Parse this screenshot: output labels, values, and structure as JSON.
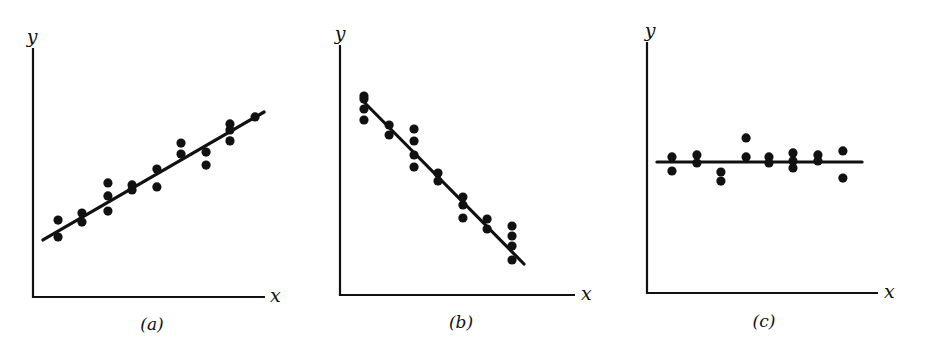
{
  "figure": {
    "ink_color": "#111111",
    "background": "#ffffff"
  },
  "chart_data": [
    {
      "type": "scatter",
      "panel_label": "(a)",
      "caption_letter": "a",
      "xlabel": "x",
      "ylabel": "y",
      "title": "",
      "grid": false,
      "legend": null,
      "xlim": [
        0,
        100
      ],
      "ylim": [
        0,
        100
      ],
      "trend": "positive linear",
      "points": [
        {
          "x": 10.8,
          "y": 30.9
        },
        {
          "x": 10.8,
          "y": 24.1
        },
        {
          "x": 21.1,
          "y": 33.7
        },
        {
          "x": 21.1,
          "y": 30.1
        },
        {
          "x": 32.3,
          "y": 45.8
        },
        {
          "x": 32.3,
          "y": 40.6
        },
        {
          "x": 32.3,
          "y": 34.5
        },
        {
          "x": 42.7,
          "y": 45.0
        },
        {
          "x": 42.7,
          "y": 43.0
        },
        {
          "x": 53.4,
          "y": 51.4
        },
        {
          "x": 53.4,
          "y": 44.2
        },
        {
          "x": 63.8,
          "y": 61.8
        },
        {
          "x": 63.8,
          "y": 57.4
        },
        {
          "x": 74.6,
          "y": 58.2
        },
        {
          "x": 74.6,
          "y": 53.0
        },
        {
          "x": 84.9,
          "y": 69.5
        },
        {
          "x": 84.9,
          "y": 67.1
        },
        {
          "x": 84.9,
          "y": 62.7
        },
        {
          "x": 95.7,
          "y": 72.3
        }
      ],
      "fit_line": {
        "x1": 4.3,
        "y1": 22.9,
        "x2": 99.6,
        "y2": 74.3
      }
    },
    {
      "type": "scatter",
      "panel_label": "(b)",
      "caption_letter": "b",
      "xlabel": "x",
      "ylabel": "y",
      "title": "",
      "grid": false,
      "legend": null,
      "xlim": [
        0,
        100
      ],
      "ylim": [
        0,
        100
      ],
      "trend": "negative linear",
      "points": [
        {
          "x": 10.2,
          "y": 79.6
        },
        {
          "x": 10.2,
          "y": 78.4
        },
        {
          "x": 10.2,
          "y": 74.4
        },
        {
          "x": 10.2,
          "y": 70.0
        },
        {
          "x": 20.9,
          "y": 68.0
        },
        {
          "x": 20.9,
          "y": 64.0
        },
        {
          "x": 31.5,
          "y": 66.4
        },
        {
          "x": 31.5,
          "y": 61.6
        },
        {
          "x": 31.5,
          "y": 56.0
        },
        {
          "x": 31.5,
          "y": 51.2
        },
        {
          "x": 41.7,
          "y": 48.8
        },
        {
          "x": 41.7,
          "y": 45.6
        },
        {
          "x": 52.3,
          "y": 39.2
        },
        {
          "x": 52.3,
          "y": 36.0
        },
        {
          "x": 52.3,
          "y": 30.8
        },
        {
          "x": 62.6,
          "y": 30.4
        },
        {
          "x": 62.6,
          "y": 26.4
        },
        {
          "x": 73.2,
          "y": 27.6
        },
        {
          "x": 73.2,
          "y": 23.6
        },
        {
          "x": 73.2,
          "y": 19.6
        },
        {
          "x": 73.2,
          "y": 14.0
        }
      ],
      "fit_line": {
        "x1": 10.6,
        "y1": 76.8,
        "x2": 78.3,
        "y2": 12.4
      }
    },
    {
      "type": "scatter",
      "panel_label": "(c)",
      "caption_letter": "c",
      "xlabel": "x",
      "ylabel": "y",
      "title": "",
      "grid": false,
      "legend": null,
      "xlim": [
        0,
        100
      ],
      "ylim": [
        0,
        100
      ],
      "trend": "no correlation (horizontal)",
      "points": [
        {
          "x": 10.8,
          "y": 54.2
        },
        {
          "x": 10.8,
          "y": 48.6
        },
        {
          "x": 21.6,
          "y": 55.0
        },
        {
          "x": 21.6,
          "y": 51.8
        },
        {
          "x": 32.0,
          "y": 48.2
        },
        {
          "x": 32.0,
          "y": 44.6
        },
        {
          "x": 42.9,
          "y": 61.8
        },
        {
          "x": 42.9,
          "y": 54.2
        },
        {
          "x": 52.8,
          "y": 54.2
        },
        {
          "x": 52.8,
          "y": 51.8
        },
        {
          "x": 63.2,
          "y": 55.8
        },
        {
          "x": 63.2,
          "y": 52.6
        },
        {
          "x": 63.2,
          "y": 49.8
        },
        {
          "x": 74.0,
          "y": 55.0
        },
        {
          "x": 74.0,
          "y": 52.6
        },
        {
          "x": 84.8,
          "y": 56.6
        },
        {
          "x": 84.8,
          "y": 45.8
        }
      ],
      "fit_line": {
        "x1": 4.3,
        "y1": 52.2,
        "x2": 93.1,
        "y2": 52.2
      }
    }
  ],
  "layout": {
    "panels": [
      {
        "left": 0,
        "axis_x0": 33,
        "axis_x1": 265,
        "axis_ytop": 48,
        "axis_ybot": 297,
        "ylabel_x": 32,
        "ylabel_y": 43,
        "xlabel_x": 270,
        "xlabel_y": 302,
        "caption_x": 152,
        "caption_y": 330
      },
      {
        "left": 0,
        "axis_x0": 340,
        "axis_x1": 575,
        "axis_ytop": 45,
        "axis_ybot": 295,
        "ylabel_x": 340,
        "ylabel_y": 40,
        "xlabel_x": 581,
        "xlabel_y": 300,
        "caption_x": 461,
        "caption_y": 328
      },
      {
        "left": 0,
        "axis_x0": 647,
        "axis_x1": 878,
        "axis_ytop": 42,
        "axis_ybot": 293,
        "ylabel_x": 650,
        "ylabel_y": 37,
        "xlabel_x": 884,
        "xlabel_y": 298,
        "caption_x": 764,
        "caption_y": 327
      }
    ],
    "point_radius": 4.6,
    "axis_stroke": 2.2,
    "line_stroke": 3.2
  }
}
